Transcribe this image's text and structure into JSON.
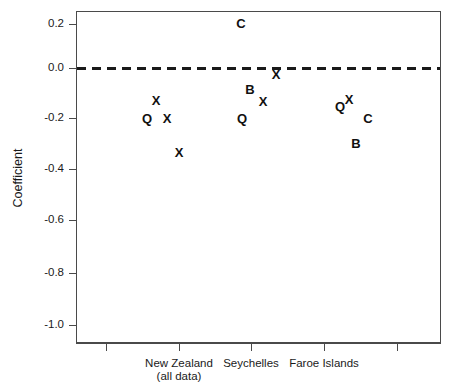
{
  "chart_data": {
    "type": "scatter",
    "title": "",
    "xlabel": "",
    "ylabel": "Coefficient",
    "ylim": [
      -1.08,
      0.28
    ],
    "yticks": [
      0.2,
      0.0,
      -0.2,
      -0.4,
      -0.6,
      -0.8,
      -1.0
    ],
    "ytick_labels": [
      "0.2",
      "0.0",
      "-0.2",
      "-0.4",
      "-0.6",
      "-0.8",
      "-1.0"
    ],
    "grid": false,
    "legend": null,
    "categories": [
      "New Zealand\n(all data)",
      "Seychelles",
      "Faroe Islands"
    ],
    "xtick_count": 5,
    "annotations": [
      {
        "text": "Reference line at y = 0",
        "style": "dashed-horizontal",
        "y": 0.0
      }
    ],
    "series": [
      {
        "name": "New Zealand (all data)",
        "group": "New Zealand (all data)",
        "points": [
          {
            "marker": "X",
            "x_offset": -0.3,
            "y": -0.13
          },
          {
            "marker": "Q",
            "x_offset": -0.42,
            "y": -0.2
          },
          {
            "marker": "X",
            "x_offset": -0.15,
            "y": -0.2
          },
          {
            "marker": "X",
            "x_offset": 0.01,
            "y": -0.33
          }
        ]
      },
      {
        "name": "Seychelles",
        "group": "Seychelles",
        "points": [
          {
            "marker": "C",
            "x_offset": -0.15,
            "y": 0.2
          },
          {
            "marker": "X",
            "x_offset": 0.34,
            "y": -0.03
          },
          {
            "marker": "B",
            "x_offset": -0.01,
            "y": -0.08
          },
          {
            "marker": "X",
            "x_offset": 0.16,
            "y": -0.13
          },
          {
            "marker": "Q",
            "x_offset": -0.12,
            "y": -0.2
          }
        ]
      },
      {
        "name": "Faroe Islands",
        "group": "Faroe Islands",
        "points": [
          {
            "marker": "Q",
            "x_offset": 0.22,
            "y": -0.15
          },
          {
            "marker": "X",
            "x_offset": 0.33,
            "y": -0.13
          },
          {
            "marker": "C",
            "x_offset": 0.57,
            "y": -0.2
          },
          {
            "marker": "B",
            "x_offset": 0.42,
            "y": -0.29
          }
        ]
      }
    ],
    "points_flat": [
      {
        "marker": "X",
        "group": "New Zealand (all data)",
        "value": -0.13,
        "px": 156,
        "py": 100
      },
      {
        "marker": "Q",
        "group": "New Zealand (all data)",
        "value": -0.2,
        "px": 147,
        "py": 118
      },
      {
        "marker": "X",
        "group": "New Zealand (all data)",
        "value": -0.2,
        "px": 167,
        "py": 118
      },
      {
        "marker": "X",
        "group": "New Zealand (all data)",
        "value": -0.33,
        "px": 179,
        "py": 152
      },
      {
        "marker": "C",
        "group": "Seychelles",
        "value": 0.2,
        "px": 241,
        "py": 23
      },
      {
        "marker": "X",
        "group": "Seychelles",
        "value": -0.03,
        "px": 276,
        "py": 74
      },
      {
        "marker": "B",
        "group": "Seychelles",
        "value": -0.08,
        "px": 250,
        "py": 89
      },
      {
        "marker": "X",
        "group": "Seychelles",
        "value": -0.13,
        "px": 263,
        "py": 101
      },
      {
        "marker": "Q",
        "group": "Seychelles",
        "value": -0.2,
        "px": 242,
        "py": 118
      },
      {
        "marker": "Q",
        "group": "Faroe Islands",
        "value": -0.15,
        "px": 340,
        "py": 106
      },
      {
        "marker": "X",
        "group": "Faroe Islands",
        "value": -0.13,
        "px": 349,
        "py": 99
      },
      {
        "marker": "C",
        "group": "Faroe Islands",
        "value": -0.2,
        "px": 368,
        "py": 118
      },
      {
        "marker": "B",
        "group": "Faroe Islands",
        "value": -0.29,
        "px": 356,
        "py": 143
      }
    ]
  },
  "axes": {
    "y_title": "Coefficient",
    "y_ticks": [
      {
        "label": "0.2",
        "py": 24
      },
      {
        "label": "0.0",
        "py": 68
      },
      {
        "label": "-0.2",
        "py": 118
      },
      {
        "label": "-0.4",
        "py": 169
      },
      {
        "label": "-0.6",
        "py": 220
      },
      {
        "label": "-0.8",
        "py": 273
      },
      {
        "label": "-1.0",
        "py": 325
      }
    ],
    "x_ticks": [
      {
        "px": 106,
        "label": "",
        "sub": ""
      },
      {
        "px": 179,
        "label": "New Zealand",
        "sub": "(all data)"
      },
      {
        "px": 251,
        "label": "Seychelles",
        "sub": ""
      },
      {
        "px": 324,
        "label": "Faroe Islands",
        "sub": ""
      },
      {
        "px": 397,
        "label": "",
        "sub": ""
      }
    ]
  },
  "colors": {
    "axis": "#4a4a4a",
    "text": "#1a1a1a",
    "marker": "#111111",
    "reference_line": "#1a1a1a",
    "background": "#ffffff"
  }
}
